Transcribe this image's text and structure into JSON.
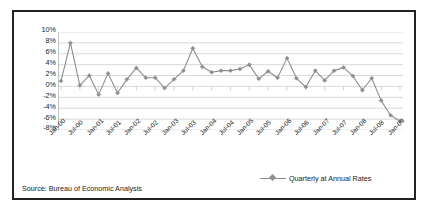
{
  "chart_data": {
    "type": "line",
    "title": "",
    "xlabel": "",
    "ylabel": "",
    "ylim": [
      -8,
      10
    ],
    "ytick_values": [
      10,
      8,
      6,
      4,
      2,
      0,
      -2,
      -4,
      -6,
      -8
    ],
    "ytick_labels": [
      "10%",
      "8%",
      "6%",
      "4%",
      "2%",
      "0%",
      "-2%",
      "-4%",
      "-6%",
      "-8%"
    ],
    "grid": true,
    "legend": [
      "Quarterly at Annual Rates"
    ],
    "legend_position": "bottom-right",
    "series_color": "#8e8e8e",
    "x_labels": [
      "Jan-00",
      "Jul-00",
      "Jan-01",
      "Jul-01",
      "Jan-02",
      "Jul-02",
      "Jan-03",
      "Jul-03",
      "Jan-04",
      "Jul-04",
      "Jan-05",
      "Jul-05",
      "Jan-06",
      "Jul-06",
      "Jan-07",
      "Jul-07",
      "Jan-08",
      "Jul-08",
      "Jan-09"
    ],
    "x_label_interval": 2,
    "x": [
      "Q1-2000",
      "Q2-2000",
      "Q3-2000",
      "Q4-2000",
      "Q1-2001",
      "Q2-2001",
      "Q3-2001",
      "Q4-2001",
      "Q1-2002",
      "Q2-2002",
      "Q3-2002",
      "Q4-2002",
      "Q1-2003",
      "Q2-2003",
      "Q3-2003",
      "Q4-2003",
      "Q1-2004",
      "Q2-2004",
      "Q3-2004",
      "Q4-2004",
      "Q1-2005",
      "Q2-2005",
      "Q3-2005",
      "Q4-2005",
      "Q1-2006",
      "Q2-2006",
      "Q3-2006",
      "Q4-2006",
      "Q1-2007",
      "Q2-2007",
      "Q3-2007",
      "Q4-2007",
      "Q1-2008",
      "Q2-2008",
      "Q3-2008",
      "Q4-2008",
      "Q1-2009"
    ],
    "series": [
      {
        "name": "Quarterly at Annual Rates",
        "values": [
          1.0,
          8.0,
          0.2,
          2.0,
          -1.5,
          2.4,
          -1.2,
          1.3,
          3.4,
          1.6,
          1.6,
          -0.3,
          1.3,
          2.9,
          7.0,
          3.6,
          2.6,
          2.9,
          2.9,
          3.2,
          4.0,
          1.4,
          2.8,
          1.6,
          5.2,
          1.5,
          -0.1,
          2.9,
          1.1,
          2.9,
          3.5,
          1.9,
          -0.7,
          1.5,
          -2.6,
          -5.3,
          -6.4
        ]
      }
    ],
    "last_point_value": -1.0,
    "annotations": []
  },
  "chart": {
    "source_note": "Source: Bureau of Economic Analysis"
  }
}
